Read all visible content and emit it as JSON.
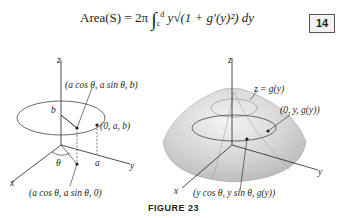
{
  "equation": {
    "lhs": "Area(S)",
    "rhs_prefix": "= 2π",
    "integral_lower": "c",
    "integral_upper": "d",
    "integrand": "y√(1 + g′(y)²) dy",
    "number": "14"
  },
  "left_figure": {
    "axis_z": "z",
    "axis_x": "x",
    "axis_y": "y",
    "point_top": "(a cos θ, a sin θ, b)",
    "point_side": "(0, a, b)",
    "point_bottom": "(a cos θ, a sin θ, 0)",
    "label_b": "b",
    "label_a": "a",
    "label_theta": "θ"
  },
  "right_figure": {
    "axis_z": "z",
    "axis_x": "x",
    "axis_y": "y",
    "surface_label": "z = g(y)",
    "point_side": "(0, y, g(y))",
    "point_general": "(y cos θ, y sin θ, g(y))"
  },
  "caption": "FIGURE 23"
}
